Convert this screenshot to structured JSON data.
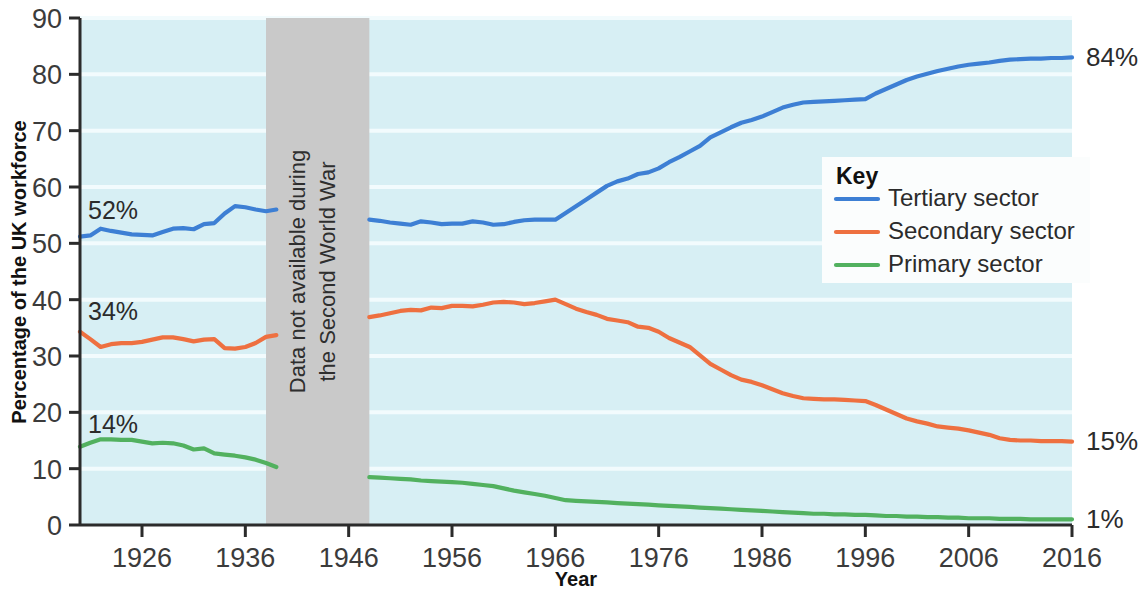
{
  "chart_data": {
    "type": "line",
    "title": "",
    "xlabel": "Year",
    "ylabel": "Percentage of the UK workforce",
    "xlim": [
      1920,
      2016
    ],
    "ylim": [
      0,
      90
    ],
    "yticks": [
      0,
      10,
      20,
      30,
      40,
      50,
      60,
      70,
      80,
      90
    ],
    "xticks": [
      1926,
      1936,
      1946,
      1956,
      1966,
      1976,
      1986,
      1996,
      2006,
      2016
    ],
    "grid": true,
    "legend_position": "right-middle",
    "legend_title": "Key",
    "annotations": [
      {
        "text": "52%",
        "series": "Tertiary sector",
        "x": 1920,
        "y": 52,
        "position": "left"
      },
      {
        "text": "34%",
        "series": "Secondary sector",
        "x": 1920,
        "y": 34,
        "position": "left"
      },
      {
        "text": "14%",
        "series": "Primary sector",
        "x": 1920,
        "y": 14,
        "position": "left"
      },
      {
        "text": "84%",
        "series": "Tertiary sector",
        "x": 2016,
        "y": 83,
        "position": "right"
      },
      {
        "text": "15%",
        "series": "Secondary sector",
        "x": 2016,
        "y": 15,
        "position": "right"
      },
      {
        "text": "1%",
        "series": "Primary sector",
        "x": 2016,
        "y": 1,
        "position": "right"
      }
    ],
    "shaded_region": {
      "label_line1": "Data not available during",
      "label_line2": "the Second World War",
      "x_start": 1938,
      "x_end": 1948,
      "color": "#c9c9c9"
    },
    "series": [
      {
        "name": "Tertiary sector",
        "color": "#3d7fd4",
        "points": [
          [
            1920,
            51.2
          ],
          [
            1921,
            51.4
          ],
          [
            1922,
            52.6
          ],
          [
            1923,
            52.2
          ],
          [
            1924,
            51.9
          ],
          [
            1925,
            51.6
          ],
          [
            1926,
            51.5
          ],
          [
            1927,
            51.4
          ],
          [
            1928,
            52.0
          ],
          [
            1929,
            52.6
          ],
          [
            1930,
            52.7
          ],
          [
            1931,
            52.5
          ],
          [
            1932,
            53.4
          ],
          [
            1933,
            53.6
          ],
          [
            1934,
            55.3
          ],
          [
            1935,
            56.6
          ],
          [
            1936,
            56.4
          ],
          [
            1937,
            56.0
          ],
          [
            1938,
            55.7
          ],
          [
            1939,
            56.0
          ],
          [
            1948,
            54.2
          ],
          [
            1949,
            54.0
          ],
          [
            1950,
            53.7
          ],
          [
            1951,
            53.5
          ],
          [
            1952,
            53.3
          ],
          [
            1953,
            53.9
          ],
          [
            1954,
            53.7
          ],
          [
            1955,
            53.4
          ],
          [
            1956,
            53.5
          ],
          [
            1957,
            53.5
          ],
          [
            1958,
            53.9
          ],
          [
            1959,
            53.7
          ],
          [
            1960,
            53.3
          ],
          [
            1961,
            53.4
          ],
          [
            1962,
            53.8
          ],
          [
            1963,
            54.1
          ],
          [
            1964,
            54.2
          ],
          [
            1965,
            54.2
          ],
          [
            1966,
            54.2
          ],
          [
            1967,
            55.4
          ],
          [
            1968,
            56.6
          ],
          [
            1969,
            57.8
          ],
          [
            1970,
            59.0
          ],
          [
            1971,
            60.2
          ],
          [
            1972,
            61.0
          ],
          [
            1973,
            61.5
          ],
          [
            1974,
            62.3
          ],
          [
            1975,
            62.6
          ],
          [
            1976,
            63.3
          ],
          [
            1977,
            64.4
          ],
          [
            1978,
            65.3
          ],
          [
            1979,
            66.3
          ],
          [
            1980,
            67.3
          ],
          [
            1981,
            68.8
          ],
          [
            1982,
            69.7
          ],
          [
            1983,
            70.6
          ],
          [
            1984,
            71.4
          ],
          [
            1985,
            71.9
          ],
          [
            1986,
            72.5
          ],
          [
            1987,
            73.3
          ],
          [
            1988,
            74.1
          ],
          [
            1989,
            74.6
          ],
          [
            1990,
            75.0
          ],
          [
            1991,
            75.1
          ],
          [
            1992,
            75.2
          ],
          [
            1993,
            75.3
          ],
          [
            1994,
            75.4
          ],
          [
            1995,
            75.5
          ],
          [
            1996,
            75.6
          ],
          [
            1997,
            76.6
          ],
          [
            1998,
            77.4
          ],
          [
            1999,
            78.2
          ],
          [
            2000,
            79.0
          ],
          [
            2001,
            79.6
          ],
          [
            2002,
            80.1
          ],
          [
            2003,
            80.6
          ],
          [
            2004,
            81.0
          ],
          [
            2005,
            81.4
          ],
          [
            2006,
            81.7
          ],
          [
            2007,
            81.9
          ],
          [
            2008,
            82.1
          ],
          [
            2009,
            82.4
          ],
          [
            2010,
            82.6
          ],
          [
            2011,
            82.7
          ],
          [
            2012,
            82.8
          ],
          [
            2013,
            82.8
          ],
          [
            2014,
            82.9
          ],
          [
            2015,
            82.9
          ],
          [
            2016,
            83.0
          ]
        ]
      },
      {
        "name": "Secondary sector",
        "color": "#ee7040",
        "points": [
          [
            1920,
            34.3
          ],
          [
            1921,
            33.0
          ],
          [
            1922,
            31.6
          ],
          [
            1923,
            32.1
          ],
          [
            1924,
            32.3
          ],
          [
            1925,
            32.3
          ],
          [
            1926,
            32.5
          ],
          [
            1927,
            32.9
          ],
          [
            1928,
            33.3
          ],
          [
            1929,
            33.3
          ],
          [
            1930,
            33.0
          ],
          [
            1931,
            32.6
          ],
          [
            1932,
            32.9
          ],
          [
            1933,
            33.0
          ],
          [
            1934,
            31.4
          ],
          [
            1935,
            31.3
          ],
          [
            1936,
            31.6
          ],
          [
            1937,
            32.3
          ],
          [
            1938,
            33.4
          ],
          [
            1939,
            33.7
          ],
          [
            1948,
            36.9
          ],
          [
            1949,
            37.2
          ],
          [
            1950,
            37.6
          ],
          [
            1951,
            38.0
          ],
          [
            1952,
            38.2
          ],
          [
            1953,
            38.1
          ],
          [
            1954,
            38.6
          ],
          [
            1955,
            38.5
          ],
          [
            1956,
            38.9
          ],
          [
            1957,
            38.9
          ],
          [
            1958,
            38.8
          ],
          [
            1959,
            39.1
          ],
          [
            1960,
            39.5
          ],
          [
            1961,
            39.6
          ],
          [
            1962,
            39.5
          ],
          [
            1963,
            39.2
          ],
          [
            1964,
            39.4
          ],
          [
            1965,
            39.7
          ],
          [
            1966,
            40.0
          ],
          [
            1967,
            39.2
          ],
          [
            1968,
            38.4
          ],
          [
            1969,
            37.8
          ],
          [
            1970,
            37.3
          ],
          [
            1971,
            36.6
          ],
          [
            1972,
            36.3
          ],
          [
            1973,
            36.0
          ],
          [
            1974,
            35.2
          ],
          [
            1975,
            35.0
          ],
          [
            1976,
            34.3
          ],
          [
            1977,
            33.2
          ],
          [
            1978,
            32.4
          ],
          [
            1979,
            31.6
          ],
          [
            1980,
            30.1
          ],
          [
            1981,
            28.6
          ],
          [
            1982,
            27.6
          ],
          [
            1983,
            26.6
          ],
          [
            1984,
            25.8
          ],
          [
            1985,
            25.4
          ],
          [
            1986,
            24.8
          ],
          [
            1987,
            24.1
          ],
          [
            1988,
            23.4
          ],
          [
            1989,
            22.9
          ],
          [
            1990,
            22.5
          ],
          [
            1991,
            22.4
          ],
          [
            1992,
            22.3
          ],
          [
            1993,
            22.3
          ],
          [
            1994,
            22.2
          ],
          [
            1995,
            22.1
          ],
          [
            1996,
            22.0
          ],
          [
            1997,
            21.3
          ],
          [
            1998,
            20.5
          ],
          [
            1999,
            19.7
          ],
          [
            2000,
            18.9
          ],
          [
            2001,
            18.4
          ],
          [
            2002,
            18.0
          ],
          [
            2003,
            17.5
          ],
          [
            2004,
            17.3
          ],
          [
            2005,
            17.1
          ],
          [
            2006,
            16.8
          ],
          [
            2007,
            16.4
          ],
          [
            2008,
            16.0
          ],
          [
            2009,
            15.4
          ],
          [
            2010,
            15.1
          ],
          [
            2011,
            15.0
          ],
          [
            2012,
            15.0
          ],
          [
            2013,
            14.9
          ],
          [
            2014,
            14.9
          ],
          [
            2015,
            14.9
          ],
          [
            2016,
            14.8
          ]
        ]
      },
      {
        "name": "Primary sector",
        "color": "#52b15f",
        "points": [
          [
            1920,
            13.9
          ],
          [
            1921,
            14.6
          ],
          [
            1922,
            15.2
          ],
          [
            1923,
            15.2
          ],
          [
            1924,
            15.1
          ],
          [
            1925,
            15.1
          ],
          [
            1926,
            14.8
          ],
          [
            1927,
            14.5
          ],
          [
            1928,
            14.6
          ],
          [
            1929,
            14.5
          ],
          [
            1930,
            14.1
          ],
          [
            1931,
            13.4
          ],
          [
            1932,
            13.6
          ],
          [
            1933,
            12.7
          ],
          [
            1934,
            12.5
          ],
          [
            1935,
            12.3
          ],
          [
            1936,
            12.0
          ],
          [
            1937,
            11.6
          ],
          [
            1938,
            11.0
          ],
          [
            1939,
            10.3
          ],
          [
            1948,
            8.5
          ],
          [
            1949,
            8.4
          ],
          [
            1950,
            8.3
          ],
          [
            1951,
            8.2
          ],
          [
            1952,
            8.1
          ],
          [
            1953,
            7.9
          ],
          [
            1954,
            7.8
          ],
          [
            1955,
            7.7
          ],
          [
            1956,
            7.6
          ],
          [
            1957,
            7.5
          ],
          [
            1958,
            7.3
          ],
          [
            1959,
            7.1
          ],
          [
            1960,
            6.9
          ],
          [
            1961,
            6.5
          ],
          [
            1962,
            6.1
          ],
          [
            1963,
            5.8
          ],
          [
            1964,
            5.5
          ],
          [
            1965,
            5.2
          ],
          [
            1966,
            4.8
          ],
          [
            1967,
            4.4
          ],
          [
            1968,
            4.3
          ],
          [
            1969,
            4.2
          ],
          [
            1970,
            4.1
          ],
          [
            1971,
            4.0
          ],
          [
            1972,
            3.9
          ],
          [
            1973,
            3.8
          ],
          [
            1974,
            3.7
          ],
          [
            1975,
            3.6
          ],
          [
            1976,
            3.5
          ],
          [
            1977,
            3.4
          ],
          [
            1978,
            3.3
          ],
          [
            1979,
            3.2
          ],
          [
            1980,
            3.1
          ],
          [
            1981,
            3.0
          ],
          [
            1982,
            2.9
          ],
          [
            1983,
            2.8
          ],
          [
            1984,
            2.7
          ],
          [
            1985,
            2.6
          ],
          [
            1986,
            2.5
          ],
          [
            1987,
            2.4
          ],
          [
            1988,
            2.3
          ],
          [
            1989,
            2.2
          ],
          [
            1990,
            2.1
          ],
          [
            1991,
            2.0
          ],
          [
            1992,
            2.0
          ],
          [
            1993,
            1.9
          ],
          [
            1994,
            1.9
          ],
          [
            1995,
            1.8
          ],
          [
            1996,
            1.8
          ],
          [
            1997,
            1.7
          ],
          [
            1998,
            1.6
          ],
          [
            1999,
            1.6
          ],
          [
            2000,
            1.5
          ],
          [
            2001,
            1.5
          ],
          [
            2002,
            1.4
          ],
          [
            2003,
            1.4
          ],
          [
            2004,
            1.3
          ],
          [
            2005,
            1.3
          ],
          [
            2006,
            1.2
          ],
          [
            2007,
            1.2
          ],
          [
            2008,
            1.2
          ],
          [
            2009,
            1.1
          ],
          [
            2010,
            1.1
          ],
          [
            2011,
            1.1
          ],
          [
            2012,
            1.0
          ],
          [
            2013,
            1.0
          ],
          [
            2014,
            1.0
          ],
          [
            2015,
            1.0
          ],
          [
            2016,
            1.0
          ]
        ]
      }
    ]
  },
  "axes": {
    "y_title": "Percentage of the UK workforce",
    "x_title": "Year",
    "y_ticks": [
      "0",
      "10",
      "20",
      "30",
      "40",
      "50",
      "60",
      "70",
      "80",
      "90"
    ],
    "x_ticks": [
      "1926",
      "1936",
      "1946",
      "1956",
      "1966",
      "1976",
      "1986",
      "1996",
      "2006",
      "2016"
    ]
  },
  "legend": {
    "title": "Key",
    "items": [
      {
        "label": "Tertiary sector",
        "color": "#3d7fd4"
      },
      {
        "label": "Secondary sector",
        "color": "#ee7040"
      },
      {
        "label": "Primary sector",
        "color": "#52b15f"
      }
    ]
  },
  "left_labels": [
    {
      "text": "52%"
    },
    {
      "text": "34%"
    },
    {
      "text": "14%"
    }
  ],
  "right_labels": [
    {
      "text": "84%"
    },
    {
      "text": "15%"
    },
    {
      "text": "1%"
    }
  ],
  "war_band": {
    "line1": "Data not available during",
    "line2": "the Second World War"
  },
  "colors": {
    "plot_background": "#d7eff4",
    "gridline": "#f2fbfd",
    "axis": "#2b2b2b",
    "band": "#c9c9c9"
  }
}
